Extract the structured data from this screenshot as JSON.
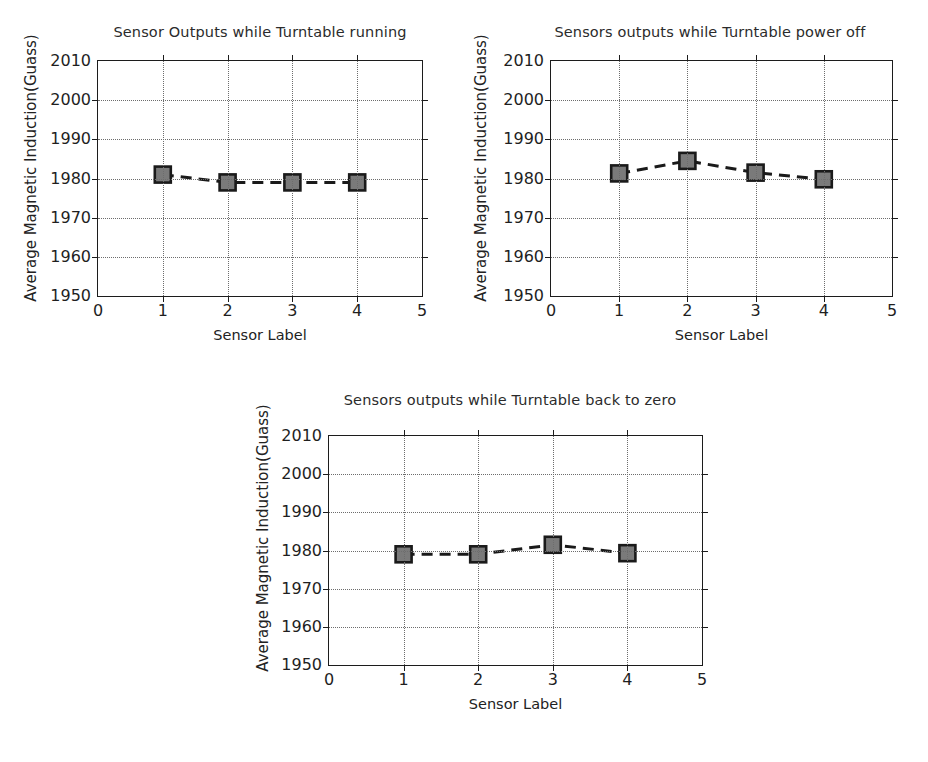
{
  "figure": {
    "background_color": "#ffffff",
    "axis_color": "#1c1c1c",
    "grid_color": "#6d6d6d",
    "marker_fill_color": "#7a7a7a",
    "marker_edge_color": "#1a1a1a",
    "line_color": "#1a1a1a"
  },
  "shared": {
    "xlabel": "Sensor Label",
    "ylabel": "Average Magnetic Induction(Guass)",
    "ytick_labels": [
      "1950",
      "1960",
      "1970",
      "1980",
      "1990",
      "2000",
      "2010"
    ],
    "xtick_labels": [
      "0",
      "1",
      "2",
      "3",
      "4",
      "5"
    ]
  },
  "chart_data": [
    {
      "id": "turntable-running",
      "type": "line",
      "title": "Sensor Outputs while Turntable running",
      "xlabel": "Sensor Label",
      "ylabel": "Average Magnetic Induction(Guass)",
      "x": [
        1,
        2,
        3,
        4
      ],
      "categories": [
        "1",
        "2",
        "3",
        "4"
      ],
      "values": [
        1981.0,
        1979.0,
        1979.0,
        1979.0
      ],
      "xlim": [
        0,
        5
      ],
      "ylim": [
        1950,
        2010
      ],
      "xticks": [
        0,
        1,
        2,
        3,
        4,
        5
      ],
      "yticks": [
        1950,
        1960,
        1970,
        1980,
        1990,
        2000,
        2010
      ],
      "grid": true,
      "grid_style": "dotted",
      "legend": false,
      "marker": "square",
      "linestyle": "dashed"
    },
    {
      "id": "turntable-power-off",
      "type": "line",
      "title": "Sensors outputs while Turntable power off",
      "xlabel": "Sensor Label",
      "ylabel": "Average Magnetic Induction(Guass)",
      "x": [
        1,
        2,
        3,
        4
      ],
      "categories": [
        "1",
        "2",
        "3",
        "4"
      ],
      "values": [
        1981.3,
        1984.5,
        1981.5,
        1979.8
      ],
      "xlim": [
        0,
        5
      ],
      "ylim": [
        1950,
        2010
      ],
      "xticks": [
        0,
        1,
        2,
        3,
        4,
        5
      ],
      "yticks": [
        1950,
        1960,
        1970,
        1980,
        1990,
        2000,
        2010
      ],
      "grid": true,
      "grid_style": "dotted",
      "legend": false,
      "marker": "square",
      "linestyle": "dashed"
    },
    {
      "id": "turntable-back-to-zero",
      "type": "line",
      "title": "Sensors outputs while Turntable back to zero",
      "xlabel": "Sensor Label",
      "ylabel": "Average Magnetic Induction(Guass)",
      "x": [
        1,
        2,
        3,
        4
      ],
      "categories": [
        "1",
        "2",
        "3",
        "4"
      ],
      "values": [
        1979.0,
        1979.0,
        1981.5,
        1979.3
      ],
      "xlim": [
        0,
        5
      ],
      "ylim": [
        1950,
        2010
      ],
      "xticks": [
        0,
        1,
        2,
        3,
        4,
        5
      ],
      "yticks": [
        1950,
        1960,
        1970,
        1980,
        1990,
        2000,
        2010
      ],
      "grid": true,
      "grid_style": "dotted",
      "legend": false,
      "marker": "square",
      "linestyle": "dashed"
    }
  ]
}
